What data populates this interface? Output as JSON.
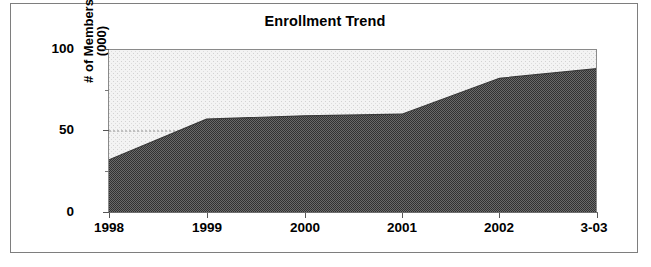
{
  "chart_data": {
    "type": "area",
    "title": "Enrollment Trend",
    "xlabel": "",
    "ylabel": "# of Members (000)",
    "ylabel_lines": [
      "# of Members",
      "(000)"
    ],
    "categories": [
      "1998",
      "1999",
      "2000",
      "2001",
      "2002",
      "3-03"
    ],
    "values": [
      32,
      57,
      59,
      60,
      82,
      88
    ],
    "series": [
      {
        "name": "# of Members (000)",
        "values": [
          32,
          57,
          59,
          60,
          82,
          88
        ]
      }
    ],
    "ylim": [
      0,
      100
    ],
    "yticks": [
      0,
      50,
      100
    ],
    "ytick_labels": [
      "0",
      "50",
      "100"
    ],
    "yticks_minor": [
      25,
      75
    ],
    "grid": "dotted horizontal gridline at 50",
    "legend": "none",
    "fill_color": "#545454",
    "background_color": "#ebebeb",
    "plot_border_color": "#8a8a8a",
    "frame_border_color": "#7e7e7e"
  }
}
